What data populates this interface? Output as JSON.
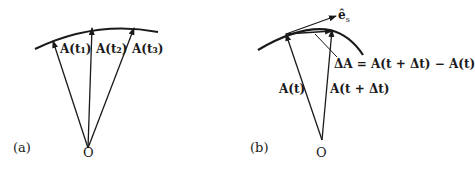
{
  "panel_a": {
    "label": "(a)",
    "origin": "O",
    "vectors": [
      "A(t₁)",
      "A(t₂)",
      "A(t₃)"
    ]
  },
  "panel_b": {
    "label": "(b)",
    "origin": "O",
    "unit_vector": "ê",
    "unit_vector_sub": "s",
    "vector_t": "A(t)",
    "vector_t_dt": "A(t + Δt)",
    "delta_eq": "ΔA = A(t + Δt) − A(t)"
  },
  "colors": {
    "ink": "#1a1a1a",
    "background": "#ffffff"
  }
}
